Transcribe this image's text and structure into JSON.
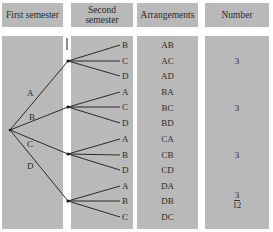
{
  "headers": {
    "first_semester": "First semester",
    "second_semester": "Second semester",
    "arrangements": "Arrangements",
    "number": "Number"
  },
  "first_branches": [
    "A",
    "B",
    "C",
    "D"
  ],
  "second_branches": [
    [
      "B",
      "C",
      "D"
    ],
    [
      "A",
      "C",
      "D"
    ],
    [
      "A",
      "B",
      "D"
    ],
    [
      "A",
      "B",
      "C"
    ]
  ],
  "arrangements": [
    "AB",
    "AC",
    "AD",
    "BA",
    "BC",
    "BD",
    "CA",
    "CB",
    "CD",
    "DA",
    "DB",
    "DC"
  ],
  "numbers": [
    "3",
    "3",
    "3",
    "3"
  ],
  "total": "12",
  "colors": {
    "panel": "#b9b9b9",
    "line": "#1a1a1a",
    "background": "#ffffff"
  }
}
